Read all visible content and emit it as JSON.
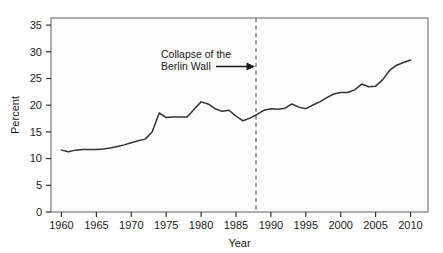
{
  "chart_data": {
    "type": "line",
    "title": "",
    "xlabel": "Year",
    "ylabel": "Percent",
    "xlim": [
      1958.5,
      2012.5
    ],
    "ylim": [
      0,
      37
    ],
    "grid": false,
    "legend": null,
    "xticks": [
      1960,
      1965,
      1970,
      1975,
      1980,
      1985,
      1990,
      1995,
      2000,
      2005,
      2010
    ],
    "yticks": [
      0,
      5,
      10,
      15,
      20,
      25,
      30,
      35
    ],
    "series": [
      {
        "name": "Percent",
        "color": "#333333",
        "x": [
          1960,
          1961,
          1962,
          1963,
          1964,
          1965,
          1966,
          1967,
          1968,
          1969,
          1970,
          1971,
          1972,
          1973,
          1974,
          1975,
          1976,
          1977,
          1978,
          1979,
          1980,
          1981,
          1982,
          1983,
          1984,
          1985,
          1986,
          1987,
          1988,
          1989,
          1990,
          1991,
          1992,
          1993,
          1994,
          1995,
          1996,
          1997,
          1998,
          1999,
          2000,
          2001,
          2002,
          2003,
          2004,
          2005,
          2006,
          2007,
          2008,
          2009,
          2010
        ],
        "y": [
          11.8,
          11.5,
          11.8,
          11.9,
          11.9,
          11.9,
          12.0,
          12.2,
          12.5,
          12.8,
          13.2,
          13.6,
          13.9,
          15.3,
          18.9,
          18.0,
          18.1,
          18.1,
          18.1,
          19.6,
          21.0,
          20.6,
          19.7,
          19.2,
          19.4,
          18.3,
          17.4,
          17.9,
          18.6,
          19.4,
          19.7,
          19.6,
          19.8,
          20.6,
          20.0,
          19.7,
          20.4,
          21.0,
          21.8,
          22.5,
          22.8,
          22.8,
          23.3,
          24.4,
          23.9,
          24.0,
          25.2,
          27.0,
          28.0,
          28.5,
          29.0
        ]
      }
    ],
    "annotations": [
      {
        "name": "berlin-wall-annotation",
        "line1": "Collapse of the",
        "line2": "Berlin Wall",
        "marker_type": "vertical-dashed-line",
        "marker_x": 1988.6
      }
    ]
  }
}
